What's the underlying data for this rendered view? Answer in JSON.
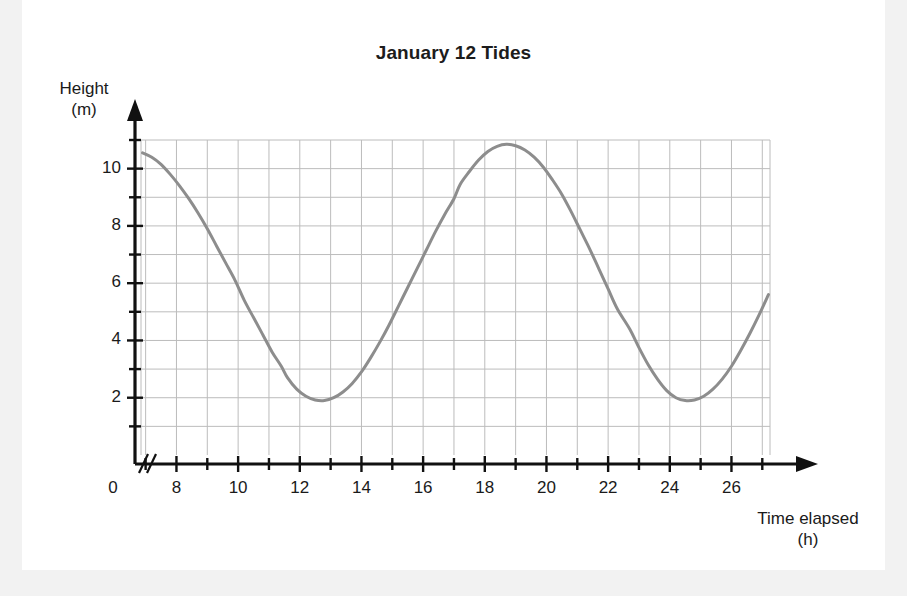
{
  "card": {
    "background": "#ffffff",
    "page_background": "#f2f2f2"
  },
  "chart_data": {
    "type": "line",
    "title": "January 12 Tides",
    "xlabel": "Time elapsed\n(h)",
    "ylabel": "Height\n(m)",
    "xlim": [
      6.85,
      27.25
    ],
    "ylim": [
      0,
      11
    ],
    "grid": true,
    "grid_color": "#bcbcbc",
    "legend": "none",
    "line_color": "#8d8d8d",
    "line_width": 3,
    "axis_break": "//",
    "x_origin_label": "0",
    "xticks_major": [
      8,
      10,
      12,
      14,
      16,
      18,
      20,
      22,
      24,
      26
    ],
    "xticks_minor": [
      7,
      9,
      11,
      13,
      15,
      17,
      19,
      21,
      23,
      25,
      27
    ],
    "xtick_labels": [
      "8",
      "10",
      "12",
      "14",
      "16",
      "18",
      "20",
      "22",
      "24",
      "26"
    ],
    "yticks_major": [
      2,
      4,
      6,
      8,
      10
    ],
    "yticks_minor": [
      1,
      3,
      5,
      7,
      9,
      11
    ],
    "ytick_labels": [
      "2",
      "4",
      "6",
      "8",
      "10"
    ],
    "annotations": {
      "first_trough": {
        "x": 11.6,
        "y": 1.9
      },
      "peak": {
        "x": 17.2,
        "y": 10.85
      },
      "second_trough": {
        "x": 22.7,
        "y": 1.9
      },
      "start_point": {
        "x": 6.9,
        "y": 10.55
      },
      "end_point": {
        "x": 27.2,
        "y": 10.4
      }
    },
    "x": [
      6.9,
      7.2,
      7.5,
      7.8,
      8.1,
      8.4,
      8.7,
      9.0,
      9.3,
      9.6,
      9.9,
      10.2,
      10.5,
      10.8,
      11.1,
      11.4,
      11.6,
      11.9,
      12.2,
      12.5,
      12.8,
      13.1,
      13.4,
      13.7,
      14.0,
      14.3,
      14.6,
      14.9,
      15.2,
      15.5,
      15.8,
      16.1,
      16.4,
      16.7,
      17.0,
      17.2,
      17.5,
      17.8,
      18.1,
      18.4,
      18.7,
      19.0,
      19.3,
      19.6,
      19.9,
      20.2,
      20.5,
      20.8,
      21.1,
      21.4,
      21.7,
      22.0,
      22.3,
      22.7,
      23.0,
      23.3,
      23.6,
      23.9,
      24.2,
      24.5,
      24.8,
      25.1,
      25.4,
      25.7,
      26.0,
      26.3,
      26.6,
      26.9,
      27.2
    ],
    "y": [
      10.55,
      10.4,
      10.15,
      9.8,
      9.4,
      8.95,
      8.45,
      7.9,
      7.3,
      6.7,
      6.1,
      5.4,
      4.8,
      4.2,
      3.6,
      3.1,
      2.7,
      2.3,
      2.05,
      1.92,
      1.9,
      2.0,
      2.2,
      2.5,
      2.9,
      3.4,
      3.95,
      4.55,
      5.2,
      5.85,
      6.5,
      7.15,
      7.8,
      8.4,
      8.95,
      9.45,
      9.9,
      10.3,
      10.6,
      10.78,
      10.85,
      10.8,
      10.65,
      10.4,
      10.05,
      9.6,
      9.1,
      8.5,
      7.85,
      7.2,
      6.5,
      5.8,
      5.1,
      4.4,
      3.75,
      3.15,
      2.65,
      2.25,
      2.0,
      1.9,
      1.92,
      2.05,
      2.3,
      2.65,
      3.1,
      3.65,
      4.25,
      4.9,
      5.6
    ]
  },
  "geometry": {
    "plot_left": 141,
    "plot_right": 770,
    "plot_top": 140,
    "plot_bottom": 455,
    "px_per_hour": 28.52,
    "px_per_meter": 28.55,
    "y_axis_x": 135,
    "x_axis_y": 464
  }
}
